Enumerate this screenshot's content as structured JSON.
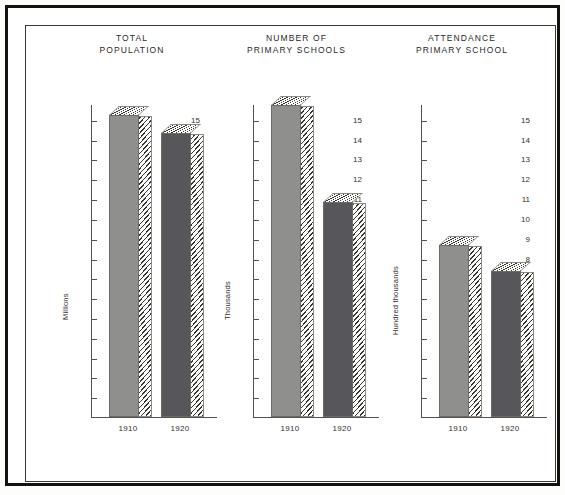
{
  "document": {
    "kind": "printed-figure-plate",
    "background_color": "#ffffff",
    "frame_color": "#14120f"
  },
  "palette": {
    "bar_1910": "#8f8f8d",
    "bar_1920": "#57565a",
    "axis": "#55524d",
    "text": "#33302c"
  },
  "chart_data": [
    {
      "type": "bar",
      "title": "TOTAL\nPOPULATION",
      "xlabel": "",
      "ylabel": "Millions",
      "categories": [
        "1910",
        "1920"
      ],
      "values": [
        15.25,
        14.35
      ],
      "ylim": [
        0,
        15.8
      ],
      "yticks": [
        1,
        2,
        3,
        4,
        5,
        6,
        7,
        8,
        9,
        10,
        11,
        12,
        13,
        14,
        15
      ],
      "grid": false,
      "legend": "none"
    },
    {
      "type": "bar",
      "title": "NUMBER OF\nPRIMARY SCHOOLS",
      "xlabel": "",
      "ylabel": "Thousands",
      "categories": [
        "1910",
        "1920"
      ],
      "values": [
        15.75,
        10.85
      ],
      "ylim": [
        0,
        15.8
      ],
      "yticks": [
        1,
        2,
        3,
        4,
        5,
        6,
        7,
        8,
        9,
        10,
        11,
        12,
        13,
        14,
        15
      ],
      "grid": false,
      "legend": "none"
    },
    {
      "type": "bar",
      "title": "ATTENDANCE\nPRIMARY SCHOOL",
      "xlabel": "",
      "ylabel": "Hundred thousands",
      "categories": [
        "1910",
        "1920"
      ],
      "values": [
        8.7,
        7.35
      ],
      "ylim": [
        0,
        15.8
      ],
      "yticks": [
        1,
        2,
        3,
        4,
        5,
        6,
        7,
        8,
        9,
        10,
        11,
        12,
        13,
        14,
        15
      ],
      "grid": false,
      "legend": "none"
    }
  ]
}
